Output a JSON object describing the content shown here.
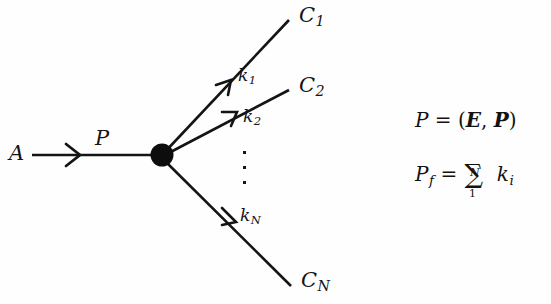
{
  "figure": {
    "kind": "feynman-like-decay-diagram",
    "background_color": "#fefefe",
    "ink_color": "#141414"
  },
  "labels": {
    "incoming_particle": "A",
    "incoming_momentum": "P",
    "outgoing_1": "C",
    "outgoing_1_sub": "1",
    "outgoing_2": "C",
    "outgoing_2_sub": "2",
    "outgoing_n": "C",
    "outgoing_n_sub": "N",
    "momentum_1": "k",
    "momentum_1_sub": "1",
    "momentum_2": "k",
    "momentum_2_sub": "2",
    "momentum_n": "k",
    "momentum_n_sub": "N",
    "ellipsis": "vertical-ellipsis"
  },
  "equations": {
    "line1": {
      "lhs": "P",
      "eq": "=",
      "open": "(",
      "energy": "E",
      "comma": ",",
      "three_momentum": "P",
      "close": ")",
      "plain": "P = (E, P)"
    },
    "line2": {
      "lhs": "P",
      "lhs_sub": "f",
      "eq": "=",
      "sigma": "∑",
      "upper_limit": "N",
      "lower_limit": "1",
      "term": "k",
      "term_sub": "i",
      "plain": "P_f = ∑_1^N k_i"
    }
  },
  "geometry": {
    "vertex": {
      "x": 162,
      "y": 155,
      "radius": 11
    },
    "incoming_line": {
      "x1": 32,
      "y1": 155,
      "x2": 162,
      "y2": 155
    },
    "incoming_arrow_at": {
      "x": 74,
      "y": 155
    },
    "branches": [
      {
        "name": "C1",
        "x2": 289,
        "y2": 20,
        "arrow_x": 227,
        "arrow_y": 86
      },
      {
        "name": "C2",
        "x2": 289,
        "y2": 90,
        "arrow_x": 232,
        "arrow_y": 120
      },
      {
        "name": "CN",
        "x2": 291,
        "y2": 286,
        "arrow_x": 233,
        "arrow_y": 218
      }
    ],
    "ellipsis": {
      "x": 244,
      "y": 152,
      "count": 3,
      "spacing": 14
    }
  }
}
